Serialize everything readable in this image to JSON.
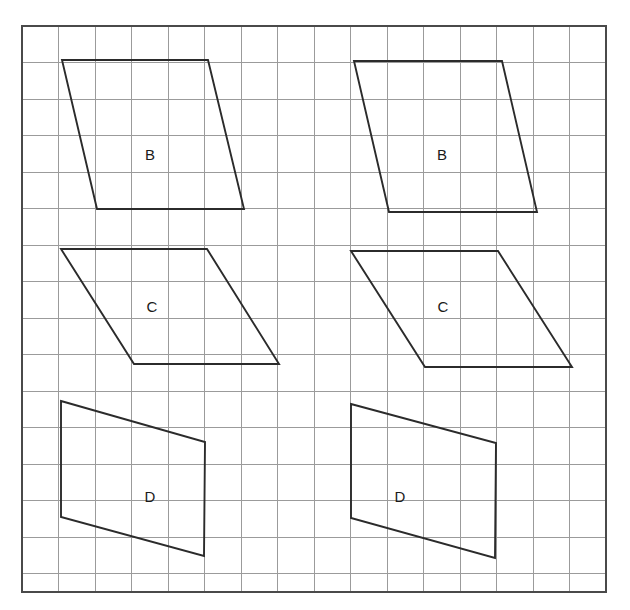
{
  "figure": {
    "background_color": "#ffffff",
    "grid": {
      "origin_x": 22,
      "origin_y": 26,
      "cell_size": 36.5,
      "columns": 16,
      "rows": 15.5,
      "line_color": "#9b9b9b",
      "border_color": "#4a4a4a",
      "border_width": 2.2,
      "show_grid": true
    },
    "shape_style": {
      "stroke_color": "#2b2b2b",
      "stroke_width": 1.9,
      "fill": "none"
    },
    "label_style": {
      "color": "#1a1a1a",
      "font_size": 15
    }
  },
  "shapes": [
    {
      "id": "shape-b-left",
      "label": "B",
      "column": "left",
      "type": "parallelogram",
      "points": "62,60 208,60 244,209 97,209",
      "label_x": 150,
      "label_y": 156
    },
    {
      "id": "shape-b-right",
      "label": "B",
      "column": "right",
      "type": "parallelogram",
      "points": "354,61 502,61 537,212 389,212",
      "label_x": 442,
      "label_y": 156
    },
    {
      "id": "shape-c-left",
      "label": "C",
      "column": "left",
      "type": "parallelogram",
      "points": "61,249 207,249 279,364 134,364",
      "label_x": 152,
      "label_y": 308
    },
    {
      "id": "shape-c-right",
      "label": "C",
      "column": "right",
      "type": "parallelogram",
      "points": "351,251 498,251 572,367 425,367",
      "label_x": 443,
      "label_y": 308
    },
    {
      "id": "shape-d-left",
      "label": "D",
      "column": "left",
      "type": "trapezium",
      "points": "61,401 205,442 204,556 61,517",
      "label_x": 150,
      "label_y": 498
    },
    {
      "id": "shape-d-right",
      "label": "D",
      "column": "right",
      "type": "trapezium",
      "points": "351,404 496,443 495,558 351,518",
      "label_x": 400,
      "label_y": 498
    }
  ]
}
